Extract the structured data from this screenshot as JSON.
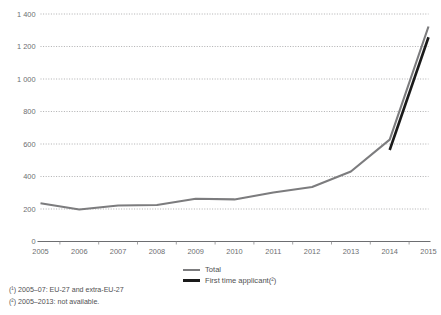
{
  "chart_data": {
    "type": "line",
    "title": "",
    "xlabel": "",
    "ylabel": "",
    "x": [
      2005,
      2006,
      2007,
      2008,
      2009,
      2010,
      2011,
      2012,
      2013,
      2014,
      2015
    ],
    "categories": [
      "2005",
      "2006",
      "2007",
      "2008",
      "2009",
      "2010",
      "2011",
      "2012",
      "2013",
      "2014",
      "2015"
    ],
    "xlim": [
      2005,
      2015
    ],
    "ylim": [
      0,
      1400
    ],
    "ytick_values": [
      0,
      200,
      400,
      600,
      800,
      1000,
      1200,
      1400
    ],
    "ytick_labels": [
      "0",
      "200",
      "400",
      "600",
      "800",
      "1 000",
      "1 200",
      "1 400"
    ],
    "grid": true,
    "legend_position": "bottom-center",
    "series": [
      {
        "name": "Total",
        "color": "#7c7c7e",
        "x": [
          2005,
          2006,
          2007,
          2008,
          2009,
          2010,
          2011,
          2012,
          2013,
          2014,
          2015
        ],
        "values": [
          235,
          197,
          222,
          225,
          263,
          259,
          302,
          335,
          431,
          627,
          1323
        ]
      },
      {
        "name": "First time applicant(²)",
        "color": "#1a1a1a",
        "x": [
          2014,
          2015
        ],
        "values": [
          563,
          1257
        ]
      }
    ]
  },
  "legend": {
    "items": [
      {
        "label": "Total",
        "swatch": "total"
      },
      {
        "label": "First time applicant(²)",
        "swatch": "first"
      }
    ]
  },
  "footnotes": [
    "(¹) 2005–07: EU-27 and extra-EU-27",
    "(²) 2005–2013: not available."
  ]
}
